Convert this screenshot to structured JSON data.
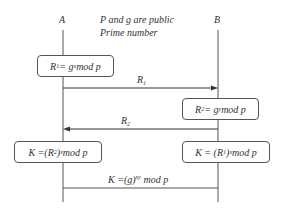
{
  "parties": {
    "a": "A",
    "b": "B"
  },
  "header_note": {
    "line1": "P and g are public",
    "line2": "Prime number"
  },
  "steps": {
    "a_compute": {
      "lhs": "R",
      "lhs_sub": "1",
      "eq": " = g",
      "exp": "x",
      "rest": " mod p"
    },
    "msg1": {
      "label": "R",
      "sub": "1",
      "direction": "A→B"
    },
    "b_compute": {
      "lhs": "R",
      "lhs_sub": "2",
      "eq": " = g",
      "exp": "y",
      "rest": " mod p"
    },
    "msg2": {
      "label": "R",
      "sub": "2",
      "direction": "B→A"
    },
    "a_key": {
      "pre": "K =(R",
      "sub": "2",
      "post": ")",
      "exp": "x",
      "rest": " mod p"
    },
    "b_key": {
      "pre": "K = (R",
      "sub": "1",
      "post": ")",
      "exp": "x",
      "rest": " mod p"
    },
    "shared": {
      "pre": "K =(g)",
      "exp": "xy",
      "rest": " mod p"
    }
  }
}
